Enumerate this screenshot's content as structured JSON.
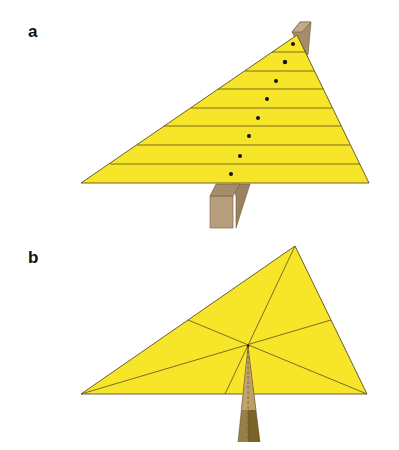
{
  "panels": [
    {
      "label": "a",
      "description": "Triangle balanced on a horizontal beam edge; divided into horizontal strips, each strip's balance point marked with a dot",
      "triangle": {
        "apex": [
          297,
          35
        ],
        "left": [
          81,
          183
        ],
        "right": [
          369,
          183
        ]
      },
      "strip_lines_y": [
        52,
        71,
        89,
        108,
        126,
        145,
        164
      ],
      "dots": [
        [
          293,
          44
        ],
        [
          285,
          62
        ],
        [
          276,
          81
        ],
        [
          267,
          99
        ],
        [
          258,
          118
        ],
        [
          249,
          136
        ],
        [
          240,
          156
        ],
        [
          231,
          174
        ]
      ],
      "support": "wooden-beam"
    },
    {
      "label": "b",
      "description": "Triangle balanced on a pointed support at its centroid where the three medians intersect",
      "triangle": {
        "apex": [
          295,
          246
        ],
        "left": [
          81,
          394
        ],
        "right": [
          367,
          394
        ]
      },
      "centroid": [
        248,
        346
      ],
      "support": "pointed-pyramid"
    }
  ],
  "colors": {
    "triangle_fill": "#f7e52a",
    "triangle_stroke": "#5a5020",
    "beam_light": "#b79f7d",
    "beam_dark": "#9a8262",
    "pyramid_light": "#b99a66",
    "pyramid_dark": "#7a6228",
    "dot": "#111111"
  }
}
